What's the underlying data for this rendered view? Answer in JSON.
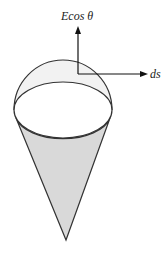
{
  "diagram": {
    "labels": {
      "field_component": "Ecos θ",
      "area_element": "ds"
    },
    "colors": {
      "cone_fill": "#d9d9d9",
      "cap_fill": "#f2f2f2",
      "stroke": "#333333"
    }
  }
}
